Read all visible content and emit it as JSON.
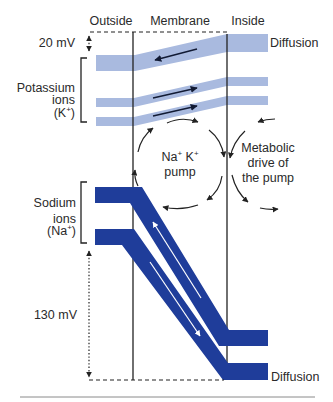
{
  "figure": {
    "column_headers": {
      "outside": "Outside",
      "membrane": "Membrane",
      "inside": "Inside"
    },
    "voltage_labels": {
      "potassium_gap": "20 mV",
      "sodium_gap": "130 mV"
    },
    "potassium_label": {
      "line1": "Potassium",
      "line2": "ions",
      "ion_open": "(K",
      "ion_charge": "+",
      "ion_close": ")"
    },
    "sodium_label": {
      "line1": "Sodium",
      "line2": "ions",
      "ion_open": "(Na",
      "ion_charge": "+",
      "ion_close": ")"
    },
    "pump_label": {
      "ion1": "Na",
      "ion1_charge": "+",
      "ion2": " K",
      "ion2_charge": "+",
      "line2": "pump"
    },
    "metabolic_label": {
      "line1": "Metabolic",
      "line2": "drive of",
      "line3": "the pump"
    },
    "diffusion_labels": {
      "potassium": "Diffusion",
      "sodium": "Diffusion"
    },
    "bands": {
      "potassium": {
        "count": 3,
        "flow_arrows": [
          "outward",
          "inward",
          "inward"
        ]
      },
      "sodium": {
        "count": 2,
        "flow_arrows": [
          "outward",
          "inward"
        ]
      }
    },
    "colors": {
      "potassium_band": "#a9badf",
      "sodium_band": "#1f3d9a",
      "text": "#2a2a2a",
      "line": "#222222",
      "rule": "#8a8a8a"
    }
  }
}
